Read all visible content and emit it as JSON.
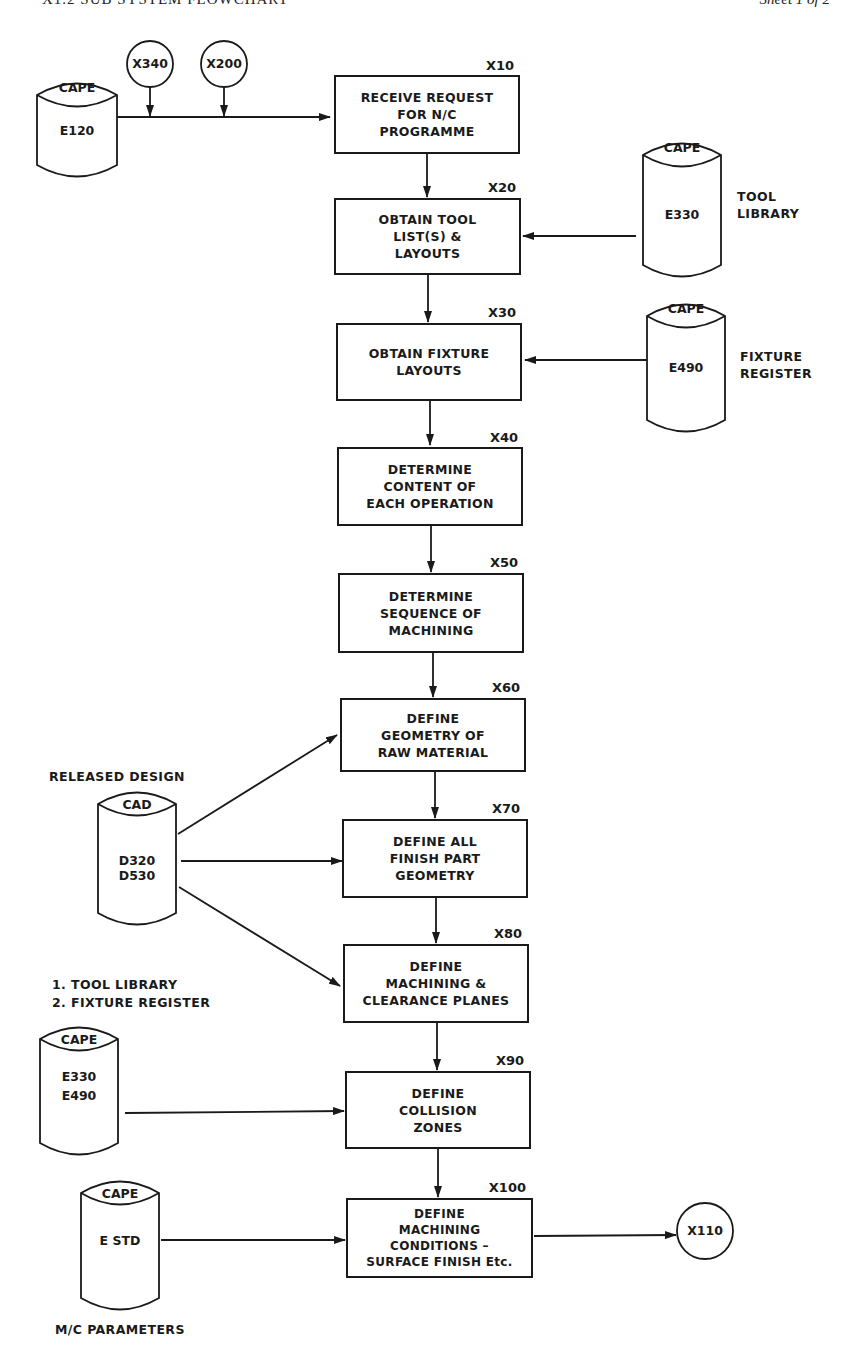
{
  "header": {
    "title": "X1.2   SUB SYSTEM FLOWCHART",
    "sheet": "Sheet  1  of  2"
  },
  "connectors": {
    "x340": "X340",
    "x200": "X200",
    "x110": "X110"
  },
  "processes": [
    {
      "id": "X10",
      "label": "RECEIVE REQUEST\nFOR N/C\nPROGRAMME"
    },
    {
      "id": "X20",
      "label": "OBTAIN TOOL\nLIST(S)  &\nLAYOUTS"
    },
    {
      "id": "X30",
      "label": "OBTAIN FIXTURE\nLAYOUTS"
    },
    {
      "id": "X40",
      "label": "DETERMINE\nCONTENT OF\nEACH OPERATION"
    },
    {
      "id": "X50",
      "label": "DETERMINE\nSEQUENCE OF\nMACHINING"
    },
    {
      "id": "X60",
      "label": "DEFINE\nGEOMETRY OF\nRAW MATERIAL"
    },
    {
      "id": "X70",
      "label": "DEFINE ALL\nFINISH PART\nGEOMETRY"
    },
    {
      "id": "X80",
      "label": "DEFINE\nMACHINING &\nCLEARANCE PLANES"
    },
    {
      "id": "X90",
      "label": "DEFINE\nCOLLISION\nZONES"
    },
    {
      "id": "X100",
      "label": "DEFINE\nMACHINING\nCONDITIONS –\nSURFACE FINISH Etc."
    }
  ],
  "datastores": [
    {
      "system": "CAPE",
      "code": "E120",
      "caption": ""
    },
    {
      "system": "CAPE",
      "code": "E330",
      "caption": "TOOL\nLIBRARY"
    },
    {
      "system": "CAPE",
      "code": "E490",
      "caption": "FIXTURE\nREGISTER"
    },
    {
      "system": "CAD",
      "code": "D320\nD530",
      "caption": "RELEASED DESIGN"
    },
    {
      "system": "CAPE",
      "code": "E330\nE490",
      "caption": "1. TOOL LIBRARY\n2. FIXTURE REGISTER"
    },
    {
      "system": "CAPE",
      "code": "E STD",
      "caption": "M/C PARAMETERS"
    }
  ]
}
